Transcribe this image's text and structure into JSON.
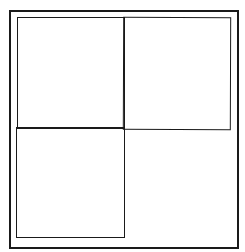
{
  "diagram": {
    "type": "quadrant-grid",
    "background_color": "#ffffff",
    "line_color": "#1a1a1a",
    "outer_frame": {
      "x": 9,
      "y": 10,
      "width": 228,
      "height": 237
    },
    "quadrants": [
      {
        "position": "top-left",
        "outlined": true
      },
      {
        "position": "top-right",
        "outlined": true
      },
      {
        "position": "bottom-left",
        "outlined": true
      },
      {
        "position": "bottom-right",
        "outlined": false
      }
    ]
  }
}
